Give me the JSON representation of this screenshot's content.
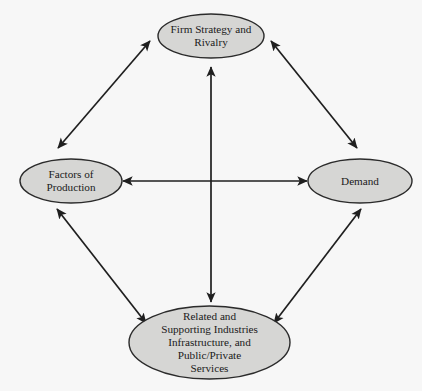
{
  "diagram": {
    "style": {
      "background_color": "#f7f7f7",
      "node_fill_color": "#d6d6d4",
      "node_stroke_color": "#2b2b2b",
      "arrow_color": "#1f1f1f",
      "text_color": "#1a1a1a"
    },
    "nodes": [
      {
        "id": "firm-strategy",
        "label": "Firm Strategy and\nRivalry",
        "lines": [
          "Firm Strategy and",
          "Rivalry"
        ],
        "shape": "ellipse",
        "cx": 211,
        "cy": 36,
        "rx": 53,
        "ry": 22
      },
      {
        "id": "factors-of-production",
        "label": "Factors of\nProduction",
        "lines": [
          "Factors of",
          "Production"
        ],
        "shape": "ellipse",
        "cx": 71,
        "cy": 181,
        "rx": 51,
        "ry": 22
      },
      {
        "id": "demand",
        "label": "Demand",
        "lines": [
          "Demand"
        ],
        "shape": "ellipse",
        "cx": 360,
        "cy": 181,
        "rx": 52,
        "ry": 22
      },
      {
        "id": "related-supporting-industries",
        "label": "Related and\nSupporting Industries\nInfrastructure, and\nPublic/Private\nServices",
        "lines": [
          "Related and",
          "Supporting Industries",
          "Infrastructure, and",
          "Public/Private",
          "Services"
        ],
        "shape": "ellipse",
        "cx": 209.5,
        "cy": 342.5,
        "rx": 80.5,
        "ry": 36.5
      }
    ],
    "connectors": [
      {
        "id": "firm-strategy-to-factors",
        "from": "factors-of-production",
        "to": "firm-strategy",
        "arrowheads": "both",
        "x1": 58,
        "y1": 148,
        "x2": 150,
        "y2": 41
      },
      {
        "id": "firm-strategy-to-demand",
        "from": "firm-strategy",
        "to": "demand",
        "arrowheads": "both",
        "x1": 271,
        "y1": 41,
        "x2": 357,
        "y2": 148
      },
      {
        "id": "factors-to-demand",
        "from": "factors-of-production",
        "to": "demand",
        "arrowheads": "both",
        "x1": 123,
        "y1": 181,
        "x2": 307,
        "y2": 181
      },
      {
        "id": "firm-strategy-to-related",
        "from": "firm-strategy",
        "to": "related-supporting-industries",
        "arrowheads": "both",
        "x1": 211,
        "y1": 67,
        "x2": 211,
        "y2": 302
      },
      {
        "id": "factors-to-related",
        "from": "factors-of-production",
        "to": "related-supporting-industries",
        "arrowheads": "both",
        "x1": 57,
        "y1": 209,
        "x2": 146,
        "y2": 323
      },
      {
        "id": "demand-to-related",
        "from": "related-supporting-industries",
        "to": "demand",
        "arrowheads": "both",
        "x1": 274,
        "y1": 323,
        "x2": 361,
        "y2": 209
      }
    ]
  }
}
